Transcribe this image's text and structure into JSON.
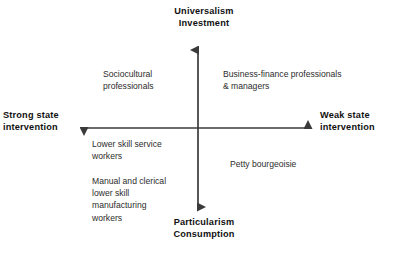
{
  "diagram": {
    "type": "two-by-two-quadrant",
    "axes": {
      "vertical": {
        "top_label": "Universalism\nInvestment",
        "bottom_label": "Particularism\nConsumption",
        "arrowheads": "both"
      },
      "horizontal": {
        "left_label": "Strong state\nintervention",
        "right_label": "Weak state\nintervention",
        "arrowheads": "both"
      }
    },
    "quadrants": {
      "upper_left": "Sociocultural\nprofessionals",
      "upper_right": "Business-finance professionals\n& managers",
      "lower_left_primary": "Lower skill service\nworkers",
      "lower_left_secondary": "Manual and clerical\nlower skill\nmanufacturing\nworkers",
      "lower_right": "Petty bourgeoisie"
    },
    "colors": {
      "background": "#ffffff",
      "axis_line": "#3a3a3a",
      "axis_label_text": "#111111",
      "quadrant_label_text": "#2c2c2c"
    }
  }
}
